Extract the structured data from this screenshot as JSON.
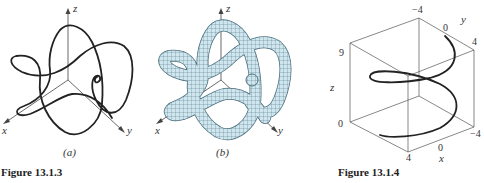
{
  "figure_a": {
    "sublabel": "(a)",
    "axes": {
      "x": "x",
      "y": "y",
      "z": "z"
    },
    "curve_color": "#222222"
  },
  "figure_b": {
    "sublabel": "(b)",
    "axes": {
      "x": "x",
      "y": "y",
      "z": "z"
    },
    "tube_fill": "#cfe6ef",
    "mesh_color": "#4a6f7d"
  },
  "caption_left": "Figure 13.1.3",
  "figure_c": {
    "axes": {
      "x": "x",
      "y": "y",
      "z": "z"
    },
    "ticks": {
      "z_top": "9",
      "z_bottom": "0",
      "y_left": "−4",
      "y_mid": "0",
      "y_right": "4",
      "x_front": "4",
      "x_mid": "0",
      "x_back": "−4"
    }
  },
  "caption_right": "Figure 13.1.4"
}
